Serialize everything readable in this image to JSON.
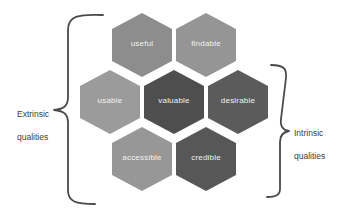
{
  "hexagons": [
    {
      "label": "useful",
      "color": "#8d8d8d"
    },
    {
      "label": "findable",
      "color": "#959595"
    },
    {
      "label": "usable",
      "color": "#9b9b9b"
    },
    {
      "label": "valuable",
      "color": "#4e4e4e"
    },
    {
      "label": "desirable",
      "color": "#5b5b5b"
    },
    {
      "label": "accessible",
      "color": "#979797"
    },
    {
      "label": "credible",
      "color": "#575757"
    }
  ],
  "labels": {
    "left": {
      "line1": "Extrinsic",
      "line2": "qualities"
    },
    "right": {
      "line1": "Intrinsic",
      "line2": "qualities"
    }
  },
  "colors": {
    "hex_text": "#f2f2f2",
    "bracket": "#4a4a4a",
    "label_text": "#3c3c3c",
    "background": "#ffffff"
  }
}
